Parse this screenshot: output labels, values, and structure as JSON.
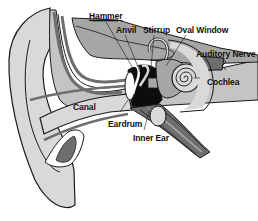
{
  "diagram": {
    "labels": [
      {
        "id": "hammer",
        "text": "Hammer",
        "x": 89,
        "y": 12
      },
      {
        "id": "anvil",
        "text": "Anvil",
        "x": 116,
        "y": 26
      },
      {
        "id": "stirrup",
        "text": "Stirrup",
        "x": 143,
        "y": 26
      },
      {
        "id": "oval-window",
        "text": "Oval Window",
        "x": 176,
        "y": 26
      },
      {
        "id": "auditory-nerve",
        "text": "Auditory Nerve",
        "x": 196,
        "y": 50
      },
      {
        "id": "cochlea",
        "text": "Cochlea",
        "x": 207,
        "y": 78
      },
      {
        "id": "canal",
        "text": "Canal",
        "x": 73,
        "y": 103
      },
      {
        "id": "eardrum",
        "text": "Eardrum",
        "x": 108,
        "y": 120
      },
      {
        "id": "inner-ear",
        "text": "Inner Ear",
        "x": 133,
        "y": 134
      }
    ],
    "colors": {
      "outline": "#1a1a1a",
      "light_gray": "#d9d9d9",
      "mid_gray": "#a6a6a6",
      "dark_gray": "#6e6e6e",
      "black_fill": "#0d0d0d",
      "background": "#ffffff"
    }
  }
}
